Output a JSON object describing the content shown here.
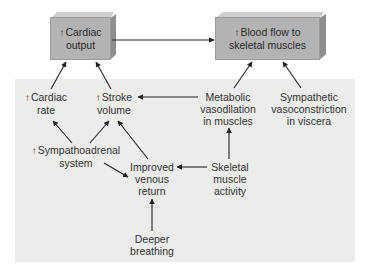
{
  "boxes": {
    "cardiac_output": {
      "line1": "Cardiac",
      "line2": "output",
      "indicator": "↑"
    },
    "blood_flow": {
      "line1": "Blood flow to",
      "line2": "skeletal muscles",
      "indicator": "↑"
    }
  },
  "nodes": {
    "cardiac_rate": {
      "line1": "Cardiac",
      "line2": "rate",
      "indicator": "↑"
    },
    "stroke_volume": {
      "line1": "Stroke",
      "line2": "volume",
      "indicator": "↑"
    },
    "metabolic": {
      "line1": "Metabolic",
      "line2": "vasodilation",
      "line3": "in muscles"
    },
    "sympathetic": {
      "line1": "Sympathetic",
      "line2": "vasoconstriction",
      "line3": "in viscera"
    },
    "sympathoadrenal": {
      "line1": "Sympathoadrenal",
      "line2": "system",
      "indicator": "↑"
    },
    "venous_return": {
      "line1": "Improved",
      "line2": "venous",
      "line3": "return"
    },
    "skeletal_activity": {
      "line1": "Skeletal",
      "line2": "muscle",
      "line3": "activity"
    },
    "deeper_breathing": {
      "line1": "Deeper",
      "line2": "breathing"
    }
  },
  "colors": {
    "box_face": "#b3b3b3",
    "box_top": "#cfcfcf",
    "box_side": "#8e8e8e",
    "panel": "#ececec",
    "arrow": "#222222"
  }
}
